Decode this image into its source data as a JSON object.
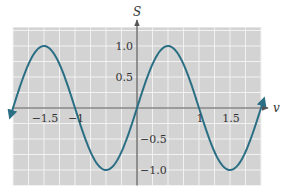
{
  "chart_data": {
    "type": "line",
    "title": "",
    "xlabel": "v",
    "ylabel": "S",
    "function": "S = sin(pi * v)",
    "xlim": [
      -2.0,
      2.0
    ],
    "ylim": [
      -1.25,
      1.3
    ],
    "curve_domain": [
      -2.05,
      2.05
    ],
    "grid": true,
    "grid_step_x": 0.25,
    "grid_step_y": 0.25,
    "x_ticks": [
      {
        "value": -1.5,
        "label": "−1.5"
      },
      {
        "value": -1,
        "label": "−1"
      },
      {
        "value": 1,
        "label": "1"
      },
      {
        "value": 1.5,
        "label": "1.5"
      }
    ],
    "y_ticks": [
      {
        "value": 1.0,
        "label": "1.0"
      },
      {
        "value": 0.5,
        "label": "0.5"
      },
      {
        "value": -0.5,
        "label": "−0.5"
      },
      {
        "value": -1.0,
        "label": "−1.0"
      }
    ],
    "series": [
      {
        "name": "S(v)",
        "x": [
          -2,
          -1.75,
          -1.5,
          -1.25,
          -1,
          -0.75,
          -0.5,
          -0.25,
          0,
          0.25,
          0.5,
          0.75,
          1,
          1.25,
          1.5,
          1.75,
          2
        ],
        "y": [
          0,
          0.707,
          1,
          0.707,
          0,
          -0.707,
          -1,
          -0.707,
          0,
          0.707,
          1,
          0.707,
          0,
          -0.707,
          -1,
          -0.707,
          0
        ]
      }
    ],
    "colors": {
      "curve": "#2a6f84",
      "grid_background": "#d3d3d3",
      "grid_lines": "#f2f2f2",
      "axes": "#555555"
    },
    "arrows": {
      "curve_ends": true,
      "axis_ends": true
    }
  }
}
